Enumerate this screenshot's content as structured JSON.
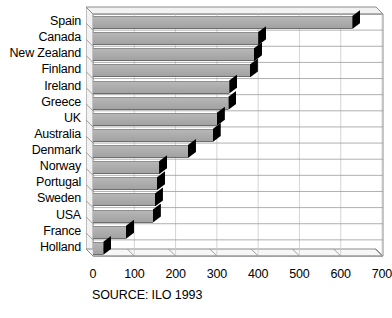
{
  "source_note": "SOURCE: ILO 1993",
  "axis": {
    "x_ticks": [
      "0",
      "100",
      "200",
      "300",
      "400",
      "500",
      "600",
      "700"
    ]
  },
  "colors": {
    "bar_fill": "#adadad",
    "bar_cap": "#000000",
    "frame_line": "#808080",
    "text": "#000000",
    "background": "#ffffff"
  },
  "chart_data": {
    "type": "bar",
    "orientation": "horizontal",
    "title": "",
    "subtitle": "",
    "xlabel": "",
    "ylabel": "",
    "xlim": [
      0,
      700
    ],
    "xticks": [
      0,
      100,
      200,
      300,
      400,
      500,
      600,
      700
    ],
    "grid": true,
    "legend": "none",
    "annotations": [
      "SOURCE: ILO 1993"
    ],
    "categories": [
      "Spain",
      "Canada",
      "New Zealand",
      "Finland",
      "Ireland",
      "Greece",
      "UK",
      "Australia",
      "Denmark",
      "Norway",
      "Portugal",
      "Sweden",
      "USA",
      "France",
      "Holland"
    ],
    "values": [
      628,
      400,
      390,
      380,
      330,
      328,
      300,
      290,
      230,
      160,
      155,
      150,
      145,
      80,
      25
    ]
  }
}
